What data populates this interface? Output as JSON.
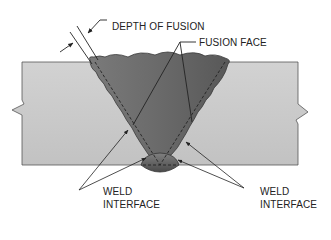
{
  "diagram": {
    "type": "weld cross-section",
    "labels": {
      "depth_of_fusion": "DEPTH OF FUSION",
      "fusion_face": "FUSION FACE",
      "weld_interface_left_1": "WELD",
      "weld_interface_left_2": "INTERFACE",
      "weld_interface_right_1": "WELD",
      "weld_interface_right_2": "INTERFACE"
    },
    "colors": {
      "base_metal": "#c9c9c9",
      "weld_metal": "#6e6e6e",
      "weld_metal_dark": "#5a5a5a",
      "outline": "#333333"
    }
  }
}
